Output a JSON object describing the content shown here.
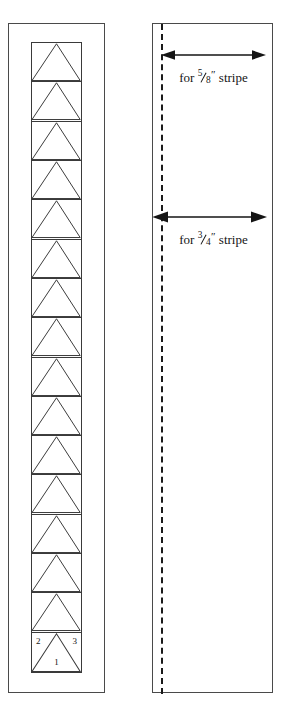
{
  "figure": {
    "name": "stripe-cutting-diagram",
    "line_color": "#3a3a3a",
    "text_color": "#151515"
  },
  "left_panel": {
    "name": "pieced-strip-panel",
    "cell_count": 16,
    "cells": [
      {
        "index": 1,
        "labels": {}
      },
      {
        "index": 2,
        "labels": {}
      },
      {
        "index": 3,
        "labels": {}
      },
      {
        "index": 4,
        "labels": {}
      },
      {
        "index": 5,
        "labels": {}
      },
      {
        "index": 6,
        "labels": {}
      },
      {
        "index": 7,
        "labels": {}
      },
      {
        "index": 8,
        "labels": {}
      },
      {
        "index": 9,
        "labels": {}
      },
      {
        "index": 10,
        "labels": {}
      },
      {
        "index": 11,
        "labels": {}
      },
      {
        "index": 12,
        "labels": {}
      },
      {
        "index": 13,
        "labels": {}
      },
      {
        "index": 14,
        "labels": {}
      },
      {
        "index": 15,
        "labels": {}
      },
      {
        "index": 16,
        "labels": {
          "left": "2",
          "right": "3",
          "center": "1"
        }
      }
    ],
    "numbered_cell": {
      "left_label": "2",
      "right_label": "3",
      "center_label": "1"
    }
  },
  "right_panel": {
    "name": "stripe-width-panel",
    "guide_line": "dashed-seam-guide",
    "dimensions": [
      {
        "id": "stripe-58",
        "prefix": "for",
        "numerator": "5",
        "denominator": "8",
        "unit": "″",
        "suffix": "stripe",
        "full_text": "for 5/8″ stripe"
      },
      {
        "id": "stripe-34",
        "prefix": "for",
        "numerator": "3",
        "denominator": "4",
        "unit": "″",
        "suffix": "stripe",
        "full_text": "for 3/4″ stripe"
      }
    ]
  }
}
